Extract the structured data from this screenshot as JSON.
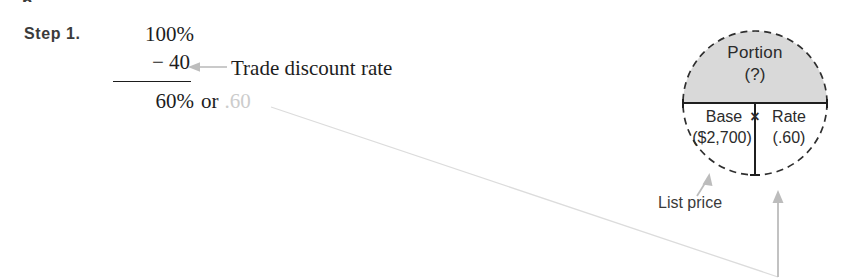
{
  "page": {
    "top_cut_fragment": "p",
    "step_label": "Step 1."
  },
  "calculation": {
    "line1": "100%",
    "line2": "− 40",
    "result": "60%",
    "result_connector": "or",
    "result_decimal": ".60",
    "annotation_label": "Trade discount rate",
    "annotation_arrow_icon": "left-arrow-icon"
  },
  "circle_diagram": {
    "top_section": {
      "label": "Portion",
      "value": "(?)"
    },
    "bottom_left": {
      "label": "Base",
      "value": "($2,700)"
    },
    "operator": "×",
    "bottom_right": {
      "label": "Rate",
      "value": "(.60)"
    },
    "callout": {
      "label": "List price",
      "arrow_icon": "up-left-arrow-icon"
    },
    "rate_leader_arrow_icon": "up-arrow-icon"
  },
  "colors": {
    "shade_fill": "#d9d9d9",
    "circle_stroke": "#2f2f2f",
    "divider_stroke": "#1f1f1f",
    "leader_gray": "#b4b4b4",
    "faint_gray": "#e2e2e2",
    "text_dark": "#1d1d1d",
    "text_faded": "#cccccc"
  }
}
